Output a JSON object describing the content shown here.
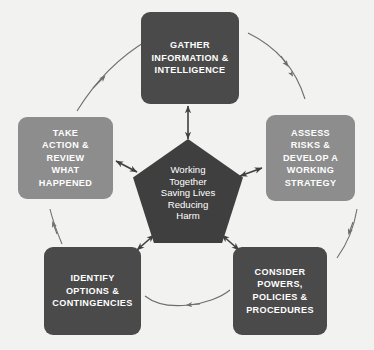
{
  "diagram": {
    "background_color": "#f2f2f0",
    "center": {
      "shape": "pentagon",
      "color": "#3f3f3f",
      "lines": [
        "Working",
        "Together",
        "Saving Lives",
        "Reducing",
        "Harm"
      ]
    },
    "nodes": [
      {
        "id": "gather",
        "label": "GATHER INFORMATION & INTELLIGENCE",
        "lines": [
          "GATHER",
          "INFORMATION &",
          "INTELLIGENCE"
        ],
        "color": "#4a4a4a",
        "position": "top"
      },
      {
        "id": "assess",
        "label": "ASSESS RISKS & DEVELOP A WORKING STRATEGY",
        "lines": [
          "ASSESS",
          "RISKS &",
          "DEVELOP A",
          "WORKING",
          "STRATEGY"
        ],
        "color": "#8d8d8d",
        "position": "right"
      },
      {
        "id": "consider",
        "label": "CONSIDER POWERS, POLICIES & PROCEDURES",
        "lines": [
          "CONSIDER",
          "POWERS,",
          "POLICIES &",
          "PROCEDURES"
        ],
        "color": "#4a4a4a",
        "position": "bottom-right"
      },
      {
        "id": "identify",
        "label": "IDENTIFY OPTIONS & CONTINGENCIES",
        "lines": [
          "IDENTIFY",
          "OPTIONS &",
          "CONTINGENCIES"
        ],
        "color": "#4a4a4a",
        "position": "bottom-left"
      },
      {
        "id": "take-action",
        "label": "TAKE ACTION & REVIEW WHAT HAPPENED",
        "lines": [
          "TAKE",
          "ACTION &",
          "REVIEW",
          "WHAT",
          "HAPPENED"
        ],
        "color": "#8d8d8d",
        "position": "left"
      }
    ],
    "cycle_arrows": {
      "style": "thin curved arc with solid arrowhead",
      "color": "#6e6e6e",
      "direction": "clockwise",
      "segments": [
        "gather-to-assess",
        "assess-to-consider",
        "consider-to-identify",
        "identify-to-take-action",
        "take-action-to-gather"
      ]
    },
    "spoke_arrows": {
      "style": "double-headed straight arrow",
      "color": "#3f3f3f",
      "targets": [
        "gather",
        "assess",
        "consider",
        "identify",
        "take-action"
      ]
    }
  }
}
